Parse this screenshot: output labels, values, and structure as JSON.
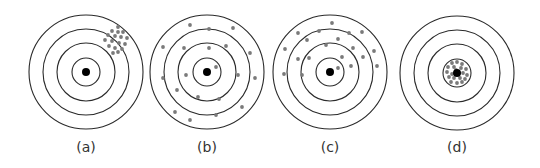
{
  "colors": {
    "ring": "#2a2a2a",
    "bullseye": "#000000",
    "shot": "#7a7a7a",
    "label": "#333333"
  },
  "ring_radii": [
    57,
    43,
    29,
    14
  ],
  "bullseye_radius": 4,
  "shot_radius": 1.9,
  "targets": [
    {
      "id": "a",
      "label": "(a)",
      "center": [
        86,
        72
      ],
      "shots": [
        [
          118,
          27
        ],
        [
          112,
          31
        ],
        [
          118,
          32
        ],
        [
          123,
          32
        ],
        [
          108,
          35
        ],
        [
          115,
          36
        ],
        [
          121,
          37
        ],
        [
          127,
          38
        ],
        [
          105,
          40
        ],
        [
          112,
          41
        ],
        [
          119,
          43
        ],
        [
          125,
          44
        ],
        [
          109,
          46
        ],
        [
          115,
          48
        ],
        [
          122,
          49
        ],
        [
          118,
          52
        ],
        [
          113,
          53
        ]
      ]
    },
    {
      "id": "b",
      "label": "(b)",
      "center": [
        207,
        72
      ],
      "shots": [
        [
          190,
          25
        ],
        [
          209,
          29
        ],
        [
          233,
          28
        ],
        [
          163,
          47
        ],
        [
          184,
          48
        ],
        [
          209,
          48
        ],
        [
          226,
          46
        ],
        [
          250,
          53
        ],
        [
          216,
          67
        ],
        [
          186,
          75
        ],
        [
          238,
          75
        ],
        [
          163,
          78
        ],
        [
          255,
          78
        ],
        [
          177,
          90
        ],
        [
          198,
          97
        ],
        [
          219,
          99
        ],
        [
          242,
          107
        ],
        [
          175,
          112
        ],
        [
          216,
          115
        ],
        [
          190,
          120
        ]
      ]
    },
    {
      "id": "c",
      "label": "(c)",
      "center": [
        330,
        72
      ],
      "shots": [
        [
          332,
          23
        ],
        [
          298,
          33
        ],
        [
          319,
          31
        ],
        [
          349,
          33
        ],
        [
          362,
          32
        ],
        [
          307,
          40
        ],
        [
          338,
          39
        ],
        [
          285,
          49
        ],
        [
          326,
          45
        ],
        [
          353,
          48
        ],
        [
          374,
          51
        ],
        [
          298,
          59
        ],
        [
          309,
          58
        ],
        [
          342,
          57
        ],
        [
          363,
          57
        ],
        [
          377,
          66
        ],
        [
          351,
          66
        ],
        [
          338,
          68
        ],
        [
          284,
          74
        ],
        [
          302,
          75
        ]
      ]
    },
    {
      "id": "d",
      "label": "(d)",
      "center": [
        457,
        73
      ],
      "shots": [
        [
          452,
          63
        ],
        [
          457,
          62
        ],
        [
          462,
          64
        ],
        [
          448,
          67
        ],
        [
          454,
          67
        ],
        [
          461,
          68
        ],
        [
          466,
          69
        ],
        [
          447,
          72
        ],
        [
          463,
          73
        ],
        [
          467,
          75
        ],
        [
          449,
          77
        ],
        [
          454,
          78
        ],
        [
          460,
          78
        ],
        [
          465,
          79
        ],
        [
          451,
          82
        ],
        [
          457,
          83
        ],
        [
          462,
          82
        ],
        [
          456,
          70
        ],
        [
          452,
          74
        ]
      ]
    }
  ]
}
